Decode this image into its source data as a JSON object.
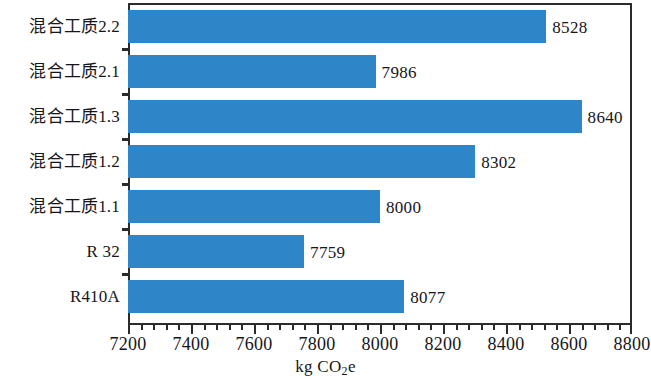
{
  "chart_data": {
    "type": "bar",
    "orientation": "horizontal",
    "title": "",
    "xlabel": "kg CO2e",
    "xlabel_parts": {
      "prefix": "kg CO",
      "sub": "2",
      "suffix": "e"
    },
    "ylabel": "",
    "xlim": [
      7200,
      8800
    ],
    "xticks": [
      7200,
      7400,
      7600,
      7800,
      8000,
      8200,
      8400,
      8600,
      8800
    ],
    "xtick_labels": [
      "7200",
      "7400",
      "7600",
      "7800",
      "8000",
      "8200",
      "8400",
      "8600",
      "8800"
    ],
    "minor_tick_step": 40,
    "grid": false,
    "legend": false,
    "bar_color": "#2e86c8",
    "axis_color": "#2b2b2b",
    "text_color": "#16161a",
    "categories": [
      "混合工质2.2",
      "混合工质2.1",
      "混合工质1.3",
      "混合工质1.2",
      "混合工质1.1",
      "R 32",
      "R410A"
    ],
    "values": [
      8528,
      7986,
      8640,
      8302,
      8000,
      7759,
      8077
    ],
    "value_labels": [
      "8528",
      "7986",
      "8640",
      "8302",
      "8000",
      "7759",
      "8077"
    ],
    "bars": [
      {
        "category": "混合工质2.2",
        "value": 8528,
        "label": "8528"
      },
      {
        "category": "混合工质2.1",
        "value": 7986,
        "label": "7986"
      },
      {
        "category": "混合工质1.3",
        "value": 8640,
        "label": "8640"
      },
      {
        "category": "混合工质1.2",
        "value": 8302,
        "label": "8302"
      },
      {
        "category": "混合工质1.1",
        "value": 8000,
        "label": "8000"
      },
      {
        "category": "R 32",
        "value": 7759,
        "label": "7759"
      },
      {
        "category": "R410A",
        "value": 8077,
        "label": "8077"
      }
    ]
  }
}
